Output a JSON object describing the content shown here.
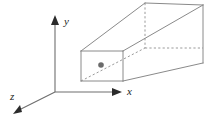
{
  "figure": {
    "background_color": "#ffffff",
    "width": 216,
    "height": 121
  },
  "axes": {
    "origin": {
      "x": 55,
      "y": 92
    },
    "line_color": "#6e6e6e",
    "arrowhead_color": "#2b2b2b",
    "items": [
      {
        "name": "y",
        "label": "y",
        "label_x": 64,
        "label_y": 25,
        "from_x": 55,
        "from_y": 92,
        "to_x": 55,
        "to_y": 20,
        "direction": "up"
      },
      {
        "name": "x",
        "label": "x",
        "label_x": 127,
        "label_y": 95,
        "from_x": 55,
        "from_y": 92,
        "to_x": 121,
        "to_y": 92,
        "direction": "right"
      },
      {
        "name": "z",
        "label": "z",
        "label_x": 10,
        "label_y": 100,
        "from_x": 55,
        "from_y": 92,
        "to_x": 15,
        "to_y": 113,
        "direction": "down-left"
      }
    ]
  },
  "box": {
    "edge_color": "#8a8a8a",
    "hidden_edge_color": "#9a9a9a",
    "hidden_edge_style": "dashed",
    "front_face": {
      "name": "front-face",
      "left": 81,
      "right": 123,
      "top": 51,
      "bottom": 81
    },
    "back_face": {
      "name": "back-face",
      "left": 145,
      "right": 203,
      "top": 3,
      "bottom": 63
    },
    "hidden_corner": {
      "x": 145,
      "y": 48
    },
    "visible_edges": [
      {
        "name": "front-top",
        "x1": 81,
        "y1": 51,
        "x2": 123,
        "y2": 51
      },
      {
        "name": "front-left",
        "x1": 81,
        "y1": 51,
        "x2": 81,
        "y2": 81
      },
      {
        "name": "front-right",
        "x1": 123,
        "y1": 51,
        "x2": 123,
        "y2": 81
      },
      {
        "name": "front-bottom",
        "x1": 81,
        "y1": 81,
        "x2": 123,
        "y2": 81
      },
      {
        "name": "top-left-connector",
        "x1": 81,
        "y1": 51,
        "x2": 145,
        "y2": 3
      },
      {
        "name": "top-right-connector",
        "x1": 123,
        "y1": 51,
        "x2": 203,
        "y2": 5
      },
      {
        "name": "bottom-right-connector",
        "x1": 123,
        "y1": 81,
        "x2": 203,
        "y2": 63
      },
      {
        "name": "back-top",
        "x1": 145,
        "y1": 3,
        "x2": 203,
        "y2": 5
      },
      {
        "name": "back-right",
        "x1": 203,
        "y1": 5,
        "x2": 203,
        "y2": 63
      }
    ],
    "hidden_edges": [
      {
        "name": "hidden-vertical",
        "x1": 145,
        "y1": 3,
        "x2": 145,
        "y2": 48
      },
      {
        "name": "hidden-back-bottom",
        "x1": 145,
        "y1": 48,
        "x2": 203,
        "y2": 48
      },
      {
        "name": "hidden-bottom-left-connector",
        "x1": 81,
        "y1": 81,
        "x2": 145,
        "y2": 48
      }
    ]
  },
  "point": {
    "name": "marked-point",
    "x": 101,
    "y": 65,
    "radius": 2.8,
    "color": "#6b6b6b"
  }
}
